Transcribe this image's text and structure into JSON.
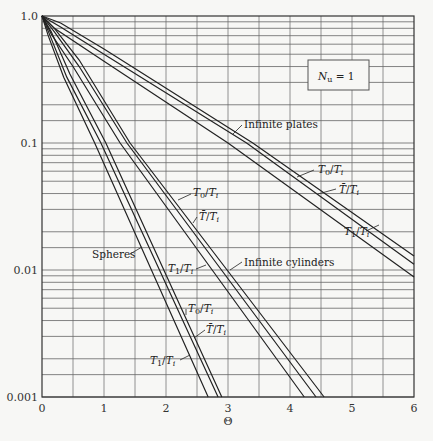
{
  "chart_data": {
    "type": "line",
    "title": "",
    "xlabel": "Θ",
    "ylabel": "",
    "xlim": [
      0,
      6
    ],
    "ylim": [
      0.001,
      1.0
    ],
    "yscale": "log",
    "grid": true,
    "x_ticks": [
      "0",
      "1",
      "2",
      "3",
      "4",
      "5",
      "6"
    ],
    "y_ticks": [
      "1.0",
      "0.1",
      "0.01",
      "0.001"
    ],
    "annotation_box": "N_u = 1",
    "series": [
      {
        "name": "Infinite plates T0/Ti",
        "group": "Infinite plates",
        "points": [
          [
            0,
            1
          ],
          [
            0.3,
            0.88
          ],
          [
            1,
            0.55
          ],
          [
            3.4,
            0.1
          ],
          [
            6,
            0.0129
          ]
        ]
      },
      {
        "name": "Infinite plates T̄/Ti",
        "group": "Infinite plates",
        "points": [
          [
            0,
            1
          ],
          [
            0.3,
            0.82
          ],
          [
            1,
            0.5
          ],
          [
            3.3,
            0.1
          ],
          [
            6,
            0.0111
          ]
        ]
      },
      {
        "name": "Infinite plates T1/Ti",
        "group": "Infinite plates",
        "points": [
          [
            0,
            1
          ],
          [
            0.2,
            0.8
          ],
          [
            1,
            0.44
          ],
          [
            3.0,
            0.1
          ],
          [
            6,
            0.0088
          ]
        ]
      },
      {
        "name": "Infinite cylinders T0/Ti",
        "group": "Infinite cylinders",
        "points": [
          [
            0,
            1
          ],
          [
            0.2,
            0.8
          ],
          [
            0.6,
            0.45
          ],
          [
            1.42,
            0.1
          ],
          [
            4.55,
            0.001
          ]
        ]
      },
      {
        "name": "Infinite cylinders T̄/Ti",
        "group": "Infinite cylinders",
        "points": [
          [
            0,
            1
          ],
          [
            0.2,
            0.75
          ],
          [
            0.6,
            0.4
          ],
          [
            1.37,
            0.1
          ],
          [
            4.42,
            0.001
          ]
        ]
      },
      {
        "name": "Infinite cylinders T1/Ti",
        "group": "Infinite cylinders",
        "points": [
          [
            0,
            1
          ],
          [
            0.15,
            0.72
          ],
          [
            0.5,
            0.4
          ],
          [
            1.26,
            0.1
          ],
          [
            4.23,
            0.001
          ]
        ]
      },
      {
        "name": "Spheres T0/Ti",
        "group": "Spheres",
        "points": [
          [
            0,
            1
          ],
          [
            0.15,
            0.75
          ],
          [
            0.45,
            0.35
          ],
          [
            1.03,
            0.1
          ],
          [
            2.9,
            0.001
          ]
        ]
      },
      {
        "name": "Spheres T̄/Ti",
        "group": "Spheres",
        "points": [
          [
            0,
            1
          ],
          [
            0.12,
            0.72
          ],
          [
            0.4,
            0.33
          ],
          [
            0.95,
            0.1
          ],
          [
            2.84,
            0.001
          ]
        ]
      },
      {
        "name": "Spheres T1/Ti",
        "group": "Spheres",
        "points": [
          [
            0,
            1
          ],
          [
            0.1,
            0.7
          ],
          [
            0.35,
            0.33
          ],
          [
            0.85,
            0.1
          ],
          [
            2.68,
            0.001
          ]
        ]
      }
    ],
    "labels": [
      {
        "text": "Infinite plates",
        "x": 244,
        "y": 128,
        "arrow": [
          242,
          125,
          233,
          134
        ]
      },
      {
        "text": "T0/Ti",
        "x": 318,
        "y": 173,
        "arrow": [
          314,
          170,
          297,
          177
        ]
      },
      {
        "text": "T̄/Ti",
        "x": 339,
        "y": 193,
        "arrow": [
          336,
          189,
          318,
          194
        ]
      },
      {
        "text": "T1/Ti",
        "x": 344,
        "y": 235,
        "arrow": [
          366,
          231,
          379,
          225
        ]
      },
      {
        "text": "T0/Ti",
        "x": 193,
        "y": 196,
        "arrow": [
          191,
          194,
          178,
          200
        ]
      },
      {
        "text": "T̄/Ti",
        "x": 199,
        "y": 220,
        "arrow": [
          197,
          217,
          193,
          223
        ]
      },
      {
        "text": "Spheres",
        "x": 92,
        "y": 258,
        "arrow": [
          130,
          254,
          142,
          247
        ]
      },
      {
        "text": "T1/Ti",
        "x": 168,
        "y": 272,
        "arrow": [
          196,
          269,
          206,
          265
        ]
      },
      {
        "text": "Infinite cylinders",
        "x": 244,
        "y": 266,
        "arrow": [
          242,
          262,
          230,
          270
        ]
      },
      {
        "text": "T0/Ti",
        "x": 188,
        "y": 312,
        "arrow": [
          186,
          309,
          186,
          315
        ]
      },
      {
        "text": "T̄/Ti",
        "x": 206,
        "y": 333,
        "arrow": [
          205,
          330,
          194,
          338
        ]
      },
      {
        "text": "T1/Ti",
        "x": 150,
        "y": 364,
        "arrow": [
          180,
          360,
          190,
          355
        ]
      }
    ]
  }
}
